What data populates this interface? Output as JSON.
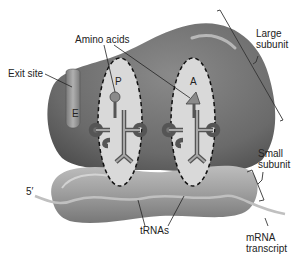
{
  "diagram": {
    "labels": {
      "amino_acids": "Amino acids",
      "exit_site": "Exit site",
      "large_subunit_line1": "Large",
      "large_subunit_line2": "subunit",
      "small_subunit_line1": "Small",
      "small_subunit_line2": "subunit",
      "trnas": "tRNAs",
      "mrna_line1": "mRNA",
      "mrna_line2": "transcript",
      "five_prime": "5′"
    },
    "sites": {
      "e": "E",
      "p": "P",
      "a": "A"
    },
    "colors": {
      "large_subunit": "#6e6e6e",
      "small_subunit": "#9a9a9a",
      "site_fill": "#d9d9d9",
      "trna": "#8a8a8a",
      "mrna": "#b5b5b5",
      "text": "#222222"
    }
  }
}
